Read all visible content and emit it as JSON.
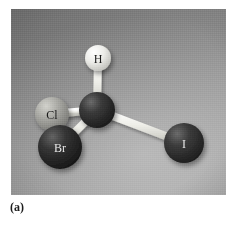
{
  "figure": {
    "caption": "(a)",
    "panel": {
      "background_top_left": "#6f6f6f",
      "background_bottom_right": "#a2a2a2",
      "width": 215,
      "height": 186
    }
  },
  "molecule": {
    "name": "CHClBrI ball-and-stick model",
    "description": "Tetrahedral chiral carbon bonded to hydrogen, chlorine, bromine and iodine",
    "bond_color": "#e8e8e4",
    "atoms": [
      {
        "id": "carbon",
        "label": "",
        "element": "C",
        "cx": 86,
        "cy": 101,
        "r": 18,
        "color": "#2e2e2e",
        "highlight": "#6a6a6a",
        "label_color": "#000000",
        "label_size": 0
      },
      {
        "id": "hydrogen",
        "label": "H",
        "element": "H",
        "cx": 87,
        "cy": 49,
        "r": 13,
        "color": "#e6e6e2",
        "highlight": "#ffffff",
        "label_color": "#1a1a1a",
        "label_size": 12
      },
      {
        "id": "chlorine",
        "label": "Cl",
        "element": "Cl",
        "cx": 41,
        "cy": 105,
        "r": 17,
        "color": "#9e9e9a",
        "highlight": "#cfcfc9",
        "label_color": "#1a1a1a",
        "label_size": 12
      },
      {
        "id": "bromine",
        "label": "Br",
        "element": "Br",
        "cx": 49,
        "cy": 138,
        "r": 22,
        "color": "#2b2b2b",
        "highlight": "#636363",
        "label_color": "#e8e8e8",
        "label_size": 12
      },
      {
        "id": "iodine",
        "label": "I",
        "element": "I",
        "cx": 173,
        "cy": 134,
        "r": 20,
        "color": "#333333",
        "highlight": "#6b6b6b",
        "label_color": "#e8e8e8",
        "label_size": 12
      }
    ],
    "bonds": [
      {
        "id": "bond-c-h",
        "from": "carbon",
        "to": "hydrogen",
        "x1": 86,
        "y1": 101,
        "x2": 87,
        "y2": 49,
        "width": 8
      },
      {
        "id": "bond-c-cl",
        "from": "carbon",
        "to": "chlorine",
        "x1": 86,
        "y1": 101,
        "x2": 41,
        "y2": 105,
        "width": 8
      },
      {
        "id": "bond-c-br",
        "from": "carbon",
        "to": "bromine",
        "x1": 86,
        "y1": 101,
        "x2": 49,
        "y2": 138,
        "width": 8
      },
      {
        "id": "bond-c-i",
        "from": "carbon",
        "to": "iodine",
        "x1": 86,
        "y1": 101,
        "x2": 173,
        "y2": 134,
        "width": 8
      }
    ]
  }
}
